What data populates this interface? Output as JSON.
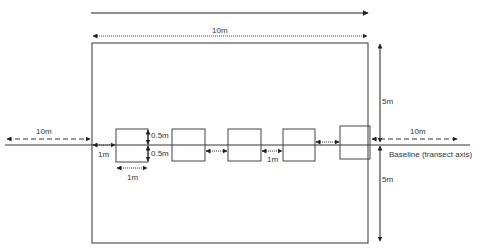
{
  "diagram": {
    "title_cropped": "",
    "colors": {
      "line": "#333333",
      "frame": "#555555",
      "background": "#ffffff"
    },
    "labels": {
      "top_width": "10m",
      "right_top_half": "5m",
      "right_bottom_half": "5m",
      "left_extension": "10m",
      "right_extension": "10m",
      "baseline": "Baseline (transect axis)",
      "start_offset": "1m",
      "quadrat_half_top": "0.5m",
      "quadrat_half_bottom": "0.5m",
      "quadrat_width": "1m",
      "quadrat_gap": "1m"
    },
    "plot": {
      "width_m": 10,
      "height_m": 10
    },
    "quadrats": [
      {
        "id": 1,
        "size": "1m x 1m"
      },
      {
        "id": 2,
        "size": "1m x 1m"
      },
      {
        "id": 3,
        "size": "1m x 1m"
      },
      {
        "id": 4,
        "size": "1m x 1m"
      },
      {
        "id": 5,
        "size": "1m x 1m"
      }
    ]
  }
}
